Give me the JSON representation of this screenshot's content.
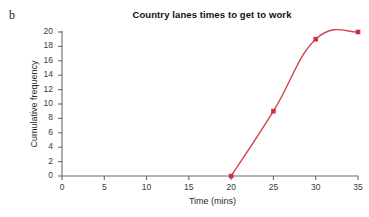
{
  "figure": {
    "part_label": "b",
    "background": "#ffffff"
  },
  "chart_data": {
    "type": "line",
    "title": "Country lanes times to get to work",
    "xlabel": "Time (mins)",
    "ylabel": "Cumulative frequency",
    "xlim": [
      0,
      35
    ],
    "ylim": [
      0,
      20
    ],
    "xticks": [
      0,
      5,
      10,
      15,
      20,
      25,
      30,
      35
    ],
    "yticks": [
      0,
      2,
      4,
      6,
      8,
      10,
      12,
      14,
      16,
      18,
      20
    ],
    "grid": false,
    "legend": null,
    "series": [
      {
        "name": "Cumulative frequency",
        "color": "#d6414f",
        "marker": "square",
        "x": [
          20,
          25,
          30,
          35
        ],
        "values": [
          0,
          9,
          19,
          20
        ],
        "points": [
          {
            "x": 20,
            "y": 0
          },
          {
            "x": 25,
            "y": 9
          },
          {
            "x": 30,
            "y": 19
          },
          {
            "x": 35,
            "y": 20
          }
        ]
      }
    ]
  },
  "axes": {
    "x_tick_labels": [
      "0",
      "5",
      "10",
      "15",
      "20",
      "25",
      "30",
      "35"
    ],
    "y_tick_labels": [
      "0",
      "2",
      "4",
      "6",
      "8",
      "10",
      "12",
      "14",
      "16",
      "18",
      "20"
    ],
    "axis_color": "#6b6b6b"
  },
  "colors": {
    "line": "#d6414f",
    "marker": "#cf2f43",
    "axis": "#6b6b6b",
    "text": "#1a1a1a"
  }
}
